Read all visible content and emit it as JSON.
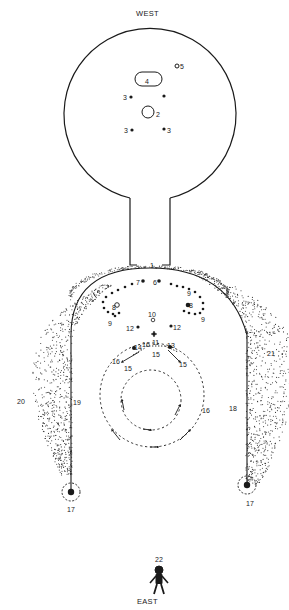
{
  "diagram": {
    "orientation": {
      "top": "WEST",
      "bottom": "EAST"
    },
    "colors": {
      "ink": "#1a1a1a",
      "stipple": "#3a3a3a",
      "background": "#ffffff"
    },
    "labels": [
      {
        "id": "west",
        "text": "WEST",
        "x": 136,
        "y": 10,
        "cls": "dir"
      },
      {
        "id": "east",
        "text": "EAST",
        "x": 137,
        "y": 598,
        "cls": "dir"
      },
      {
        "id": "n5",
        "text": "5",
        "x": 180,
        "y": 63
      },
      {
        "id": "n4",
        "text": "4",
        "x": 145,
        "y": 78
      },
      {
        "id": "n3a",
        "text": "3",
        "x": 123,
        "y": 94
      },
      {
        "id": "n2",
        "text": "2",
        "x": 156,
        "y": 111
      },
      {
        "id": "n3b",
        "text": "3",
        "x": 124,
        "y": 127
      },
      {
        "id": "n3c",
        "text": "3",
        "x": 167,
        "y": 127
      },
      {
        "id": "n1",
        "text": "1",
        "x": 150,
        "y": 262
      },
      {
        "id": "n7",
        "text": "7",
        "x": 136,
        "y": 279
      },
      {
        "id": "n6",
        "text": "6",
        "x": 153,
        "y": 279
      },
      {
        "id": "n8l",
        "text": "8",
        "x": 112,
        "y": 304
      },
      {
        "id": "n8r",
        "text": "8",
        "x": 189,
        "y": 302
      },
      {
        "id": "n9l",
        "text": "9",
        "x": 108,
        "y": 320
      },
      {
        "id": "n9tr",
        "text": "9",
        "x": 187,
        "y": 290
      },
      {
        "id": "n9br",
        "text": "9",
        "x": 201,
        "y": 316
      },
      {
        "id": "n10",
        "text": "10",
        "x": 148,
        "y": 311
      },
      {
        "id": "n12l",
        "text": "12",
        "x": 126,
        "y": 325
      },
      {
        "id": "n12r",
        "text": "12",
        "x": 173,
        "y": 324
      },
      {
        "id": "n14",
        "text": "14",
        "x": 134,
        "y": 344
      },
      {
        "id": "n16t",
        "text": "16",
        "x": 142,
        "y": 341
      },
      {
        "id": "n11",
        "text": "11",
        "x": 152,
        "y": 339
      },
      {
        "id": "n13",
        "text": "13",
        "x": 167,
        "y": 342
      },
      {
        "id": "n15t",
        "text": "15",
        "x": 152,
        "y": 351
      },
      {
        "id": "n16l",
        "text": "16",
        "x": 112,
        "y": 358
      },
      {
        "id": "n15l",
        "text": "15",
        "x": 124,
        "y": 365
      },
      {
        "id": "n15r",
        "text": "15",
        "x": 179,
        "y": 361
      },
      {
        "id": "n16r",
        "text": "16",
        "x": 202,
        "y": 407
      },
      {
        "id": "n19",
        "text": "19",
        "x": 73,
        "y": 399
      },
      {
        "id": "n20",
        "text": "20",
        "x": 17,
        "y": 398
      },
      {
        "id": "n18",
        "text": "18",
        "x": 229,
        "y": 405
      },
      {
        "id": "n21",
        "text": "21",
        "x": 267,
        "y": 350
      },
      {
        "id": "n17l",
        "text": "17",
        "x": 67,
        "y": 506
      },
      {
        "id": "n17r",
        "text": "17",
        "x": 246,
        "y": 500
      },
      {
        "id": "n22",
        "text": "22",
        "x": 155,
        "y": 556
      }
    ]
  }
}
